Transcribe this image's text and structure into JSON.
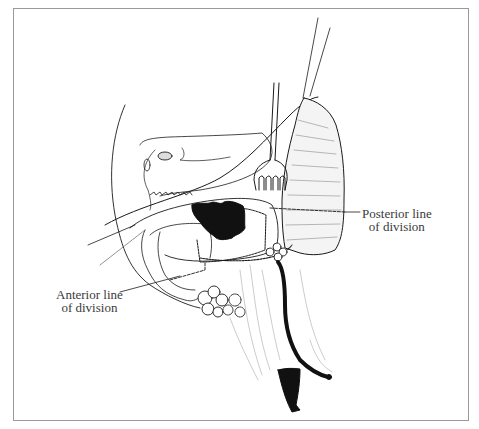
{
  "figure": {
    "type": "surgical line illustration",
    "labels": {
      "posterior": {
        "line1": "Posterior line",
        "line2": "of division"
      },
      "anterior": {
        "line1": "Anterior line",
        "line2": "of division"
      }
    },
    "colors": {
      "ink": "#1a1a1a",
      "soft_ink": "#555555",
      "frame": "#9a9a9a",
      "background": "#ffffff"
    },
    "instruments": [
      "retractor-fork",
      "retraction-sutures",
      "pointer-lines"
    ],
    "structures": [
      "tumor-mass",
      "lymph-nodes",
      "duct-tube",
      "tissue-block",
      "dissected-flap"
    ]
  }
}
